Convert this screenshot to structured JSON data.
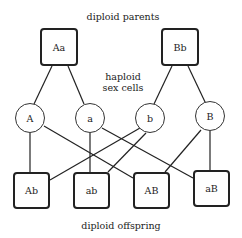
{
  "labels": {
    "parents": "diploid parents",
    "sex_cells_line1": "haploid",
    "sex_cells_line2": "sex cells",
    "offspring": "diploid offspring"
  },
  "parents": [
    {
      "label": "Aa"
    },
    {
      "label": "Bb"
    }
  ],
  "gametes": [
    {
      "label": "A"
    },
    {
      "label": "a"
    },
    {
      "label": "b"
    },
    {
      "label": "B"
    }
  ],
  "offspring": [
    {
      "label": "Ab"
    },
    {
      "label": "ab"
    },
    {
      "label": "AB"
    },
    {
      "label": "aB"
    }
  ]
}
